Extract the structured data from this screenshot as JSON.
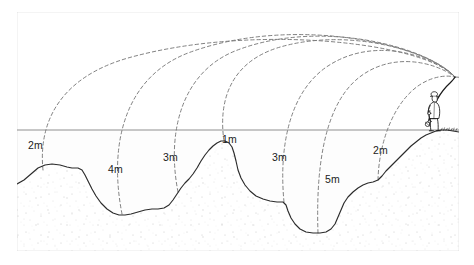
{
  "figure": {
    "frame_color": "#8a8a8a",
    "waterline_color": "#8f8f8f",
    "seabed_color": "#2b2b2b",
    "trajectory_color": "#777777",
    "angler_color": "#1a1a1a",
    "background_color": "#ffffff"
  },
  "depth_labels": [
    {
      "id": "depth-2m-left",
      "text": "2m",
      "x": 28,
      "y": 140
    },
    {
      "id": "depth-4m",
      "text": "4m",
      "x": 108,
      "y": 164
    },
    {
      "id": "depth-3m-left",
      "text": "3m",
      "x": 163,
      "y": 152
    },
    {
      "id": "depth-1m",
      "text": "1m",
      "x": 222,
      "y": 134
    },
    {
      "id": "depth-3m-right",
      "text": "3m",
      "x": 272,
      "y": 152
    },
    {
      "id": "depth-5m",
      "text": "5m",
      "x": 325,
      "y": 174
    },
    {
      "id": "depth-2m-right",
      "text": "2m",
      "x": 373,
      "y": 145
    }
  ],
  "geometry": {
    "frame": {
      "x": 16,
      "y": 11,
      "width": 444,
      "height": 241
    },
    "waterline": {
      "y": 130,
      "x1": 17,
      "x2": 459
    },
    "rod_tip": {
      "x": 455,
      "y": 77
    },
    "angler_feet": {
      "x": 437,
      "y": 131
    },
    "seabed_path": "M17,184 L24,180 L31,174 L38,168 L45,165 L52,164 L60,165 L67,167 L72,168 L78,168 L82,170 L85,175 L88,181 L92,189 L96,196 L101,203 L107,209 L113,213 L119,215 L125,215 L131,214 L138,212 L145,210 L152,209 L158,209 L164,208 L169,205 L173,200 L177,194 L181,188 L185,183 L189,179 L193,174 L197,168 L201,161 L205,155 L209,150 L213,146 L217,143 L221,141 L225,141 L229,143 L232,147 L234,153 L236,161 L238,170 L241,178 L245,185 L250,191 L256,196 L263,199 L270,201 L277,202 L283,202 L286,205 L288,211 L291,218 L295,224 L300,229 L306,232 L313,233 L320,233 L326,232 L331,229 L335,224 L338,217 L341,210 L344,203 L348,197 L353,192 L358,188 L363,185 L368,183 L373,182 L378,180 L382,176 L386,171 L391,166 L396,161 L401,156 L406,151 L411,146 L416,142 L421,138 L426,135 L431,133 L436,131 L441,130 L447,130 L453,131 L459,132",
    "trajectories": [
      {
        "id": "cast-1",
        "label_ref": "depth-2m-left",
        "landing_x": 43,
        "landing_y": 170
      },
      {
        "id": "cast-2",
        "label_ref": "depth-4m",
        "landing_x": 122,
        "landing_y": 214
      },
      {
        "id": "cast-3",
        "label_ref": "depth-3m-left",
        "landing_x": 178,
        "landing_y": 192
      },
      {
        "id": "cast-4",
        "label_ref": "depth-1m",
        "landing_x": 224,
        "landing_y": 141
      },
      {
        "id": "cast-5",
        "label_ref": "depth-3m-right",
        "landing_x": 284,
        "landing_y": 202
      },
      {
        "id": "cast-6",
        "label_ref": "depth-5m",
        "landing_x": 318,
        "landing_y": 233
      },
      {
        "id": "cast-7",
        "label_ref": "depth-2m-right",
        "landing_x": 378,
        "landing_y": 180
      }
    ]
  }
}
